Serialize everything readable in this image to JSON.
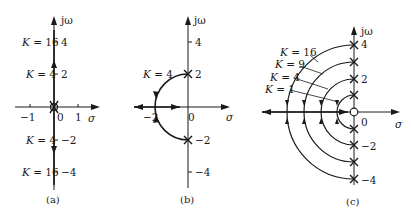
{
  "figure": {
    "colors": {
      "ink": "#1a1a1a",
      "background": "#ffffff"
    }
  },
  "panels": [
    {
      "caption": "(a)",
      "axes": {
        "imag_label": "jω",
        "real_label": "σ"
      },
      "imag_ticks": [
        "4",
        "2",
        "0",
        "−2",
        "−4"
      ],
      "real_ticks": [
        "−1",
        "0",
        "1"
      ],
      "gain_labels": [
        "K = 16",
        "K = 4",
        "K = 4",
        "K = 16"
      ],
      "poles": "double pole at origin",
      "zeros": "zero at origin"
    },
    {
      "caption": "(b)",
      "axes": {
        "imag_label": "jω",
        "real_label": "σ"
      },
      "imag_ticks": [
        "4",
        "2",
        "−2",
        "−4"
      ],
      "real_ticks": [
        "−2",
        "0"
      ],
      "gain_labels": [
        "K = 4"
      ],
      "poles": "poles at ±j2"
    },
    {
      "caption": "(c)",
      "axes": {
        "imag_label": "jω",
        "real_label": "σ"
      },
      "imag_ticks": [
        "4",
        "2",
        "−2",
        "−4"
      ],
      "real_ticks": [
        "0"
      ],
      "gain_labels": [
        "K = 16",
        "K = 9",
        "K = 4",
        "K = 1"
      ],
      "poles": "poles at ±j1, ±j2, ±j3, ±j4",
      "zeros": "zero at origin"
    }
  ]
}
